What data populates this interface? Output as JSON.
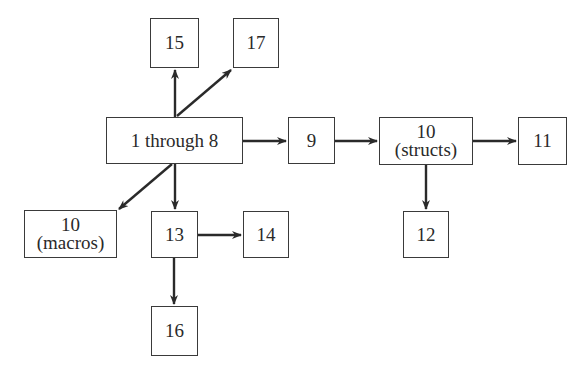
{
  "diagram": {
    "type": "dependency-graph",
    "nodes": [
      {
        "id": "n1_8",
        "line1": "1 through 8",
        "line2": ""
      },
      {
        "id": "n15",
        "line1": "15",
        "line2": ""
      },
      {
        "id": "n17",
        "line1": "17",
        "line2": ""
      },
      {
        "id": "n9",
        "line1": "9",
        "line2": ""
      },
      {
        "id": "n10s",
        "line1": "10",
        "line2": "(structs)"
      },
      {
        "id": "n11",
        "line1": "11",
        "line2": ""
      },
      {
        "id": "n12",
        "line1": "12",
        "line2": ""
      },
      {
        "id": "n10m",
        "line1": "10",
        "line2": "(macros)"
      },
      {
        "id": "n13",
        "line1": "13",
        "line2": ""
      },
      {
        "id": "n14",
        "line1": "14",
        "line2": ""
      },
      {
        "id": "n16",
        "line1": "16",
        "line2": ""
      }
    ],
    "edges": [
      {
        "from": "1 through 8",
        "to": "15"
      },
      {
        "from": "1 through 8",
        "to": "17"
      },
      {
        "from": "1 through 8",
        "to": "9"
      },
      {
        "from": "1 through 8",
        "to": "10 (macros)"
      },
      {
        "from": "1 through 8",
        "to": "13"
      },
      {
        "from": "9",
        "to": "10 (structs)"
      },
      {
        "from": "10 (structs)",
        "to": "11"
      },
      {
        "from": "10 (structs)",
        "to": "12"
      },
      {
        "from": "13",
        "to": "14"
      },
      {
        "from": "13",
        "to": "16"
      }
    ],
    "colors": {
      "stroke": "#2a2a2a",
      "background": "#ffffff"
    }
  }
}
